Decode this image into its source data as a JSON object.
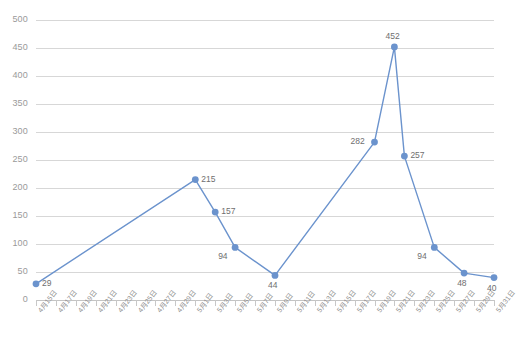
{
  "chart_data": {
    "type": "line",
    "title": "",
    "subtitle": "",
    "xlabel": "",
    "ylabel": "",
    "ylim": [
      0,
      500
    ],
    "ytick_step": 50,
    "yticks": [
      0,
      50,
      100,
      150,
      200,
      250,
      300,
      350,
      400,
      450,
      500
    ],
    "grid": true,
    "legend": false,
    "legend_position": "none",
    "line_color": "#6b93cd",
    "marker_color": "#6b93cd",
    "grid_color": "#d7d7d7",
    "axis_color": "#c4c4c4",
    "label_color": "#6f6f6f",
    "tick_label_color": "#9a9a9a",
    "categories": [
      "4月15日",
      "4月16日",
      "4月17日",
      "4月18日",
      "4月19日",
      "4月20日",
      "4月21日",
      "4月22日",
      "4月23日",
      "4月24日",
      "4月25日",
      "4月26日",
      "4月27日",
      "4月28日",
      "4月29日",
      "4月30日",
      "5月1日",
      "5月2日",
      "5月3日",
      "5月4日",
      "5月5日",
      "5月6日",
      "5月7日",
      "5月8日",
      "5月9日",
      "5月10日",
      "5月11日",
      "5月12日",
      "5月13日",
      "5月14日",
      "5月15日",
      "5月16日",
      "5月17日",
      "5月18日",
      "5月19日",
      "5月20日",
      "5月21日",
      "5月22日",
      "5月23日",
      "5月24日",
      "5月25日",
      "5月26日",
      "5月27日",
      "5月28日",
      "5月29日",
      "5月30日",
      "5月31日"
    ],
    "xtick_labels": [
      "4月15日",
      "4月17日",
      "4月19日",
      "4月21日",
      "4月23日",
      "4月25日",
      "4月27日",
      "4月29日",
      "5月1日",
      "5月3日",
      "5月5日",
      "5月7日",
      "5月9日",
      "5月11日",
      "5月13日",
      "5月15日",
      "5月17日",
      "5月19日",
      "5月21日",
      "5月23日",
      "5月25日",
      "5月27日",
      "5月29日",
      "5月31日"
    ],
    "points": [
      {
        "category": "4月15日",
        "index": 0,
        "value": 29,
        "label": "29",
        "label_pos": "right"
      },
      {
        "category": "5月1日",
        "index": 16,
        "value": 215,
        "label": "215",
        "label_pos": "right"
      },
      {
        "category": "5月3日",
        "index": 18,
        "value": 157,
        "label": "157",
        "label_pos": "right"
      },
      {
        "category": "5月5日",
        "index": 20,
        "value": 94,
        "label": "94",
        "label_pos": "below-left"
      },
      {
        "category": "5月9日",
        "index": 24,
        "value": 44,
        "label": "44",
        "label_pos": "below"
      },
      {
        "category": "5月19日",
        "index": 34,
        "value": 282,
        "label": "282",
        "label_pos": "left"
      },
      {
        "category": "5月21日",
        "index": 36,
        "value": 452,
        "label": "452",
        "label_pos": "above"
      },
      {
        "category": "5月22日",
        "index": 37,
        "value": 257,
        "label": "257",
        "label_pos": "right"
      },
      {
        "category": "5月25日",
        "index": 40,
        "value": 94,
        "label": "94",
        "label_pos": "below-left"
      },
      {
        "category": "5月28日",
        "index": 43,
        "value": 48,
        "label": "48",
        "label_pos": "below"
      },
      {
        "category": "5月31日",
        "index": 46,
        "value": 40,
        "label": "40",
        "label_pos": "below"
      }
    ],
    "caption": ""
  }
}
